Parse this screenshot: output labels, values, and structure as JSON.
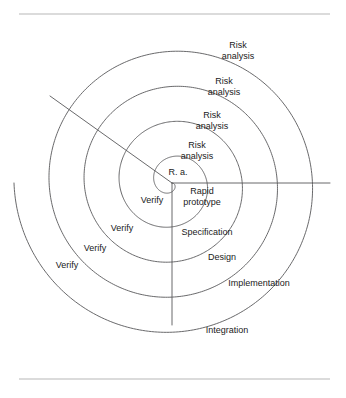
{
  "figure": {
    "name": "spiral-model-diagram",
    "type": "spiral",
    "background_color": "#ffffff",
    "line_color": "#58585a",
    "rule_color": "#b8b8b8",
    "text_color": "#1a1a1a",
    "center": {
      "x": 172,
      "y": 183
    },
    "turns": 4.5,
    "outer_radius": 158
  },
  "rules": {
    "top": {
      "x1": 19,
      "y1": 14,
      "x2": 330,
      "y2": 14
    },
    "bottom": {
      "x1": 19,
      "y1": 379,
      "x2": 330,
      "y2": 379
    }
  },
  "radials": [
    {
      "name": "radial-line-down",
      "x1": 172,
      "y1": 183,
      "x2": 172,
      "y2": 325
    },
    {
      "name": "radial-line-right",
      "x1": 172,
      "y1": 183,
      "x2": 330,
      "y2": 183
    },
    {
      "name": "radial-line-upper-left",
      "x1": 172,
      "y1": 183,
      "x2": 50,
      "y2": 96
    }
  ],
  "labels": {
    "risk_analysis": [
      {
        "text_line1": "Risk",
        "text_line2": "analysis",
        "x": 238,
        "y": 48
      },
      {
        "text_line1": "Risk",
        "text_line2": "analysis",
        "x": 224,
        "y": 84
      },
      {
        "text_line1": "Risk",
        "text_line2": "analysis",
        "x": 212,
        "y": 118
      },
      {
        "text_line1": "Risk",
        "text_line2": "analysis",
        "x": 197,
        "y": 148
      }
    ],
    "risk_analysis_abbrev": {
      "text": "R. a.",
      "x": 178,
      "y": 172
    },
    "verify": [
      {
        "text": "Verify",
        "x": 152,
        "y": 200
      },
      {
        "text": "Verify",
        "x": 122,
        "y": 228
      },
      {
        "text": "Verify",
        "x": 95,
        "y": 248
      },
      {
        "text": "Verify",
        "x": 67,
        "y": 265
      }
    ],
    "phases": [
      {
        "text_line1": "Rapid",
        "text_line2": "prototype",
        "x": 202,
        "y": 194,
        "two_line": true
      },
      {
        "text": "Specification",
        "x": 207,
        "y": 232,
        "two_line": false
      },
      {
        "text": "Design",
        "x": 222,
        "y": 257,
        "two_line": false
      },
      {
        "text": "Implementation",
        "x": 259,
        "y": 283,
        "two_line": false
      },
      {
        "text": "Integration",
        "x": 227,
        "y": 330,
        "two_line": false
      }
    ]
  },
  "caption": {
    "text": ""
  },
  "chart_data": {
    "type": "diagram",
    "center": {
      "x": 172,
      "y": 183
    },
    "quadrants": [
      {
        "name": "upper-right",
        "activity": "Risk analysis",
        "labels": [
          "Risk analysis",
          "Risk analysis",
          "Risk analysis",
          "Risk analysis",
          "R. a."
        ]
      },
      {
        "name": "lower-left",
        "activity": "Verify",
        "labels": [
          "Verify",
          "Verify",
          "Verify",
          "Verify"
        ]
      },
      {
        "name": "lower-right",
        "activity": "Development phases",
        "labels": [
          "Rapid prototype",
          "Specification",
          "Design",
          "Implementation",
          "Integration"
        ]
      },
      {
        "name": "upper-left",
        "activity": "",
        "labels": []
      }
    ],
    "spiral": {
      "turns": 4.5,
      "start_radius": 0,
      "end_radius": 158,
      "direction": "clockwise-outward"
    }
  }
}
